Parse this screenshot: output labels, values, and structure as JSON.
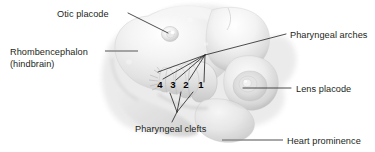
{
  "figure": {
    "domain": "anatomical-illustration",
    "background_color": "#ffffff",
    "text_color": "#231f20",
    "leader_line_color": "#231f20",
    "rule_line_color": "#8a8a8a",
    "width": 375,
    "height": 152
  },
  "labels": [
    {
      "id": "otic-placode",
      "text": "Otic placode",
      "x": 57,
      "y": 17,
      "anchor": "start"
    },
    {
      "id": "rhombencephalon",
      "text": "Rhombencephalon",
      "x": 10,
      "y": 55,
      "anchor": "start"
    },
    {
      "id": "hindbrain",
      "text": "(hindbrain)",
      "x": 10,
      "y": 67,
      "anchor": "start"
    },
    {
      "id": "pharyngeal-arches",
      "text": "Pharyngeal arches",
      "x": 290,
      "y": 38,
      "anchor": "start"
    },
    {
      "id": "lens-placode",
      "text": "Lens placode",
      "x": 296,
      "y": 92,
      "anchor": "start"
    },
    {
      "id": "heart-prominence",
      "text": "Heart prominence",
      "x": 287,
      "y": 144,
      "anchor": "start"
    },
    {
      "id": "pharyngeal-clefts",
      "text": "Pharyngeal clefts",
      "x": 135,
      "y": 132,
      "anchor": "start"
    }
  ],
  "arch_numbers": [
    {
      "id": "arch-4",
      "text": "4",
      "x": 160,
      "y": 88
    },
    {
      "id": "arch-3",
      "text": "3",
      "x": 173,
      "y": 88
    },
    {
      "id": "arch-2",
      "text": "2",
      "x": 186,
      "y": 88
    },
    {
      "id": "arch-1",
      "text": "1",
      "x": 201,
      "y": 88
    }
  ],
  "structures": [
    {
      "id": "hindbrain-mass",
      "name": "Rhombencephalon (hindbrain)"
    },
    {
      "id": "otic-vesicle",
      "name": "Otic placode"
    },
    {
      "id": "pharyngeal-arch-region",
      "name": "Pharyngeal arches 1-4"
    },
    {
      "id": "pharyngeal-cleft-region",
      "name": "Pharyngeal clefts"
    },
    {
      "id": "optic-vesicle",
      "name": "Lens placode"
    },
    {
      "id": "heart-bulge",
      "name": "Heart prominence"
    }
  ]
}
